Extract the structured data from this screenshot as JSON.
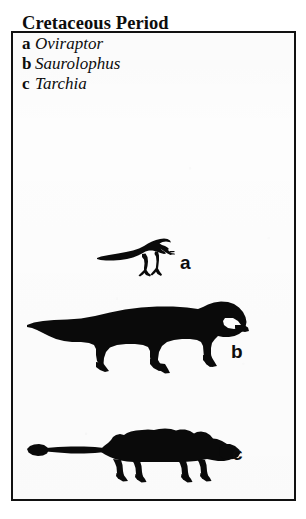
{
  "plate": {
    "title": "Cretaceous Period",
    "background_color": "#fdfdfd",
    "ink_color": "#0a0a0a",
    "frame_color": "#111111"
  },
  "legend": {
    "entries": [
      {
        "key": "a",
        "taxon": "Oviraptor"
      },
      {
        "key": "b",
        "taxon": "Saurolophus"
      },
      {
        "key": "c",
        "taxon": "Tarchia"
      }
    ]
  },
  "figures": [
    {
      "callout": "a",
      "taxon": "Oviraptor",
      "icon": "oviraptor-silhouette",
      "posture": "bipedal theropod facing right with long tapering tail",
      "relative_size": "small"
    },
    {
      "callout": "b",
      "taxon": "Saurolophus",
      "icon": "saurolophus-silhouette",
      "posture": "large hadrosaur facing right on all fours with deep tapering tail",
      "relative_size": "large"
    },
    {
      "callout": "c",
      "taxon": "Tarchia",
      "icon": "tarchia-silhouette",
      "posture": "low armoured ankylosaur facing right with clubbed tail",
      "relative_size": "medium"
    }
  ]
}
